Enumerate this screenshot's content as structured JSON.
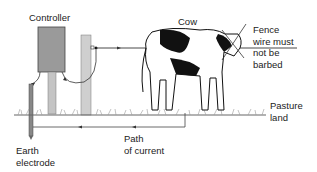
{
  "labels": {
    "controller": "Controller",
    "cow": "Cow",
    "fence_note": [
      "Fence",
      "wire must",
      "not be",
      "barbed"
    ],
    "pasture": [
      "Pasture",
      "land"
    ],
    "earth": [
      "Earth",
      "electrode"
    ],
    "path": [
      "Path",
      "of current"
    ]
  },
  "colors": {
    "controller_box": "#9a9a9a",
    "post": "#c4c4c4",
    "line": "#333333",
    "cow": "#111111"
  }
}
